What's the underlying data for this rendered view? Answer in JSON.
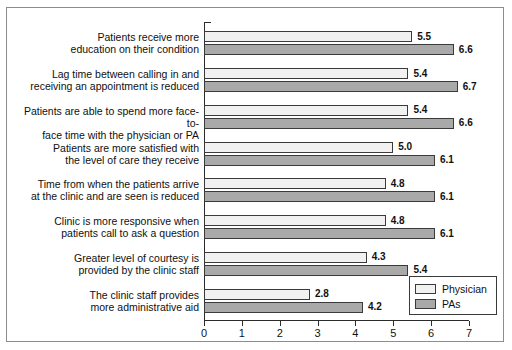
{
  "clipped_top_text": "",
  "chart_data": {
    "type": "bar",
    "orientation": "horizontal",
    "title": "",
    "xlabel": "",
    "ylabel": "",
    "xlim": [
      0,
      7
    ],
    "xticks": [
      "0",
      "1",
      "2",
      "3",
      "4",
      "5",
      "6",
      "7"
    ],
    "grid": false,
    "legend_position": "bottom-right",
    "categories": [
      "Patients receive more\neducation on their condition",
      "Lag time between calling in and\nreceiving an appointment is reduced",
      "Patients are able to spend more face-to-\nface time with the physician or PA",
      "Patients are more satisfied with\nthe level of care they receive",
      "Time from when the patients arrive\nat the clinic and are seen is reduced",
      "Clinic is more responsive when\npatients call to ask a question",
      "Greater level of courtesy is\nprovided by the clinic staff",
      "The clinic staff provides\nmore administrative aid"
    ],
    "series": [
      {
        "name": "Physician",
        "color": "#f1f1f1",
        "values": [
          5.5,
          5.4,
          5.4,
          5.0,
          4.8,
          4.8,
          4.3,
          2.8
        ],
        "labels": [
          "5.5",
          "5.4",
          "5.4",
          "5.0",
          "4.8",
          "4.8",
          "4.3",
          "2.8"
        ]
      },
      {
        "name": "PAs",
        "color": "#a9a9a9",
        "values": [
          6.6,
          6.7,
          6.6,
          6.1,
          6.1,
          6.1,
          5.4,
          4.2
        ],
        "labels": [
          "6.6",
          "6.7",
          "6.6",
          "6.1",
          "6.1",
          "6.1",
          "5.4",
          "4.2"
        ]
      }
    ]
  },
  "legend": {
    "items": [
      {
        "label": "Physician",
        "color": "#f1f1f1"
      },
      {
        "label": "PAs",
        "color": "#a9a9a9"
      }
    ]
  }
}
